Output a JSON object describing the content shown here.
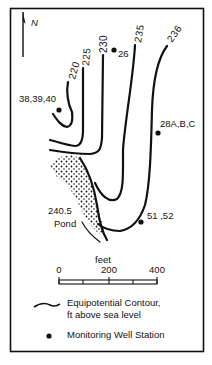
{
  "map": {
    "north_label": "N",
    "contours": [
      {
        "label": "220",
        "value": 220
      },
      {
        "label": "225",
        "value": 225
      },
      {
        "label": "230",
        "value": 230
      },
      {
        "label": "235",
        "value": 235
      },
      {
        "label": "236",
        "value": 236
      }
    ],
    "wells": [
      {
        "label": "26"
      },
      {
        "label": "38,39,40"
      },
      {
        "label": "28A,B,C"
      },
      {
        "label": "51 ,52"
      }
    ],
    "pond": {
      "elevation": "240.5",
      "name": "Pond"
    },
    "scale": {
      "unit": "feet",
      "ticks": [
        "0",
        "200",
        "400"
      ]
    }
  },
  "legend": {
    "contour_line1": "Equipotential Contour,",
    "contour_line2": "ft above sea level",
    "well": "Monitoring Well Station"
  },
  "colors": {
    "ink": "#111111",
    "background": "#ffffff"
  }
}
